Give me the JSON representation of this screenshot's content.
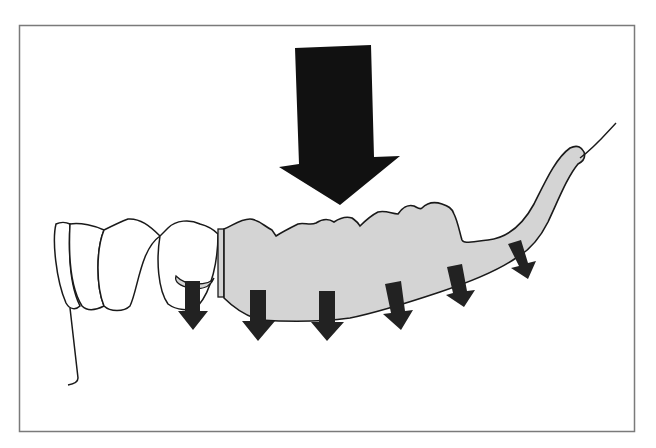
{
  "figure": {
    "colors": {
      "background": "#ffffff",
      "frame": "#7a7a7a",
      "outline": "#1a1a1a",
      "denture_base": "#d4d4d4",
      "arrow": "#222222",
      "main_arrow": "#111111"
    },
    "elements": {
      "main_force_arrow": "large downward occlusal force arrow",
      "natural_teeth": 4,
      "denture_base": "gray shaded denture saddle with artificial teeth",
      "distributed_force_arrows": 6
    }
  }
}
